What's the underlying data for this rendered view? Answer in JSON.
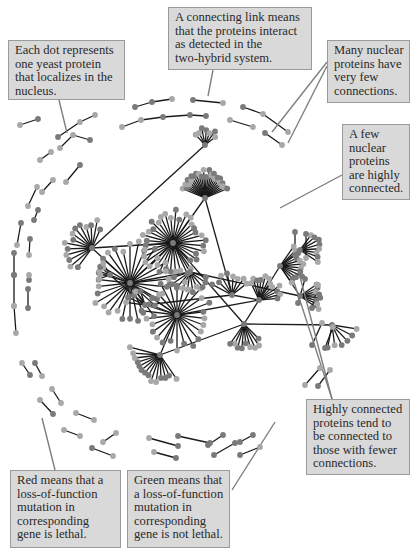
{
  "figure": {
    "node_colors": {
      "lethal_red_rendered": "#7a7a7a",
      "nonlethal_green_rendered": "#a8a8a8"
    },
    "edge_color": "#1a1a1a",
    "leader_line_color": "#7f7f7f",
    "callout_bg": "#d9d9d9",
    "callout_border": "#9a9a9a"
  },
  "callouts": [
    {
      "id": "each-dot",
      "text": "Each dot represents\none yeast protein\nthat localizes in the\nnucleus."
    },
    {
      "id": "connecting-link",
      "text": "A connecting link means\nthat the proteins interact\nas detected in the\ntwo-hybrid system."
    },
    {
      "id": "few-connections",
      "text": "Many nuclear\nproteins have\nvery few\nconnections."
    },
    {
      "id": "highly-connected",
      "text": "A few\nnuclear\nproteins\nare highly\nconnected."
    },
    {
      "id": "hubs-to-fewer",
      "text": "Highly connected\nproteins tend to\nbe connected to\nthose with fewer\nconnections."
    },
    {
      "id": "red-lethal",
      "text": "Red means that a\nloss-of-function\nmutation in\ncorresponding\ngene is lethal."
    },
    {
      "id": "green-not-lethal",
      "text": "Green means that\na loss-of-function\nmutation in\ncorresponding\ngene is not lethal."
    }
  ]
}
